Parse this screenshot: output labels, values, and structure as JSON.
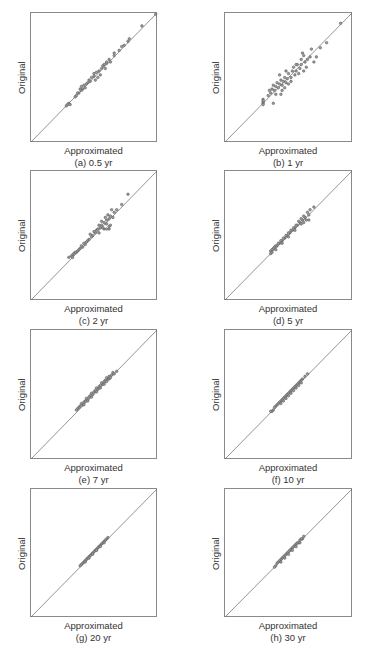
{
  "figure": {
    "colors": {
      "box": "#8a8a8a",
      "diagonal": "#666666",
      "point_fill": "#9a9a9a",
      "point_stroke": "#555555",
      "text": "#333333"
    }
  },
  "chart_data": [
    {
      "type": "scatter",
      "id": "a",
      "caption": "(a) 0.5 yr",
      "xlabel": "Approximated",
      "ylabel": "Original",
      "reference_line": "y = x",
      "ticks": "none",
      "grid": false,
      "points": [
        [
          0.99,
          0.99
        ],
        [
          0.88,
          0.9
        ],
        [
          0.78,
          0.8
        ],
        [
          0.77,
          0.78
        ],
        [
          0.72,
          0.74
        ],
        [
          0.7,
          0.71
        ],
        [
          0.66,
          0.67
        ],
        [
          0.62,
          0.64
        ],
        [
          0.6,
          0.61
        ],
        [
          0.58,
          0.6
        ],
        [
          0.56,
          0.57
        ],
        [
          0.54,
          0.55
        ],
        [
          0.52,
          0.54
        ],
        [
          0.5,
          0.51
        ],
        [
          0.48,
          0.5
        ],
        [
          0.47,
          0.47
        ],
        [
          0.45,
          0.46
        ],
        [
          0.44,
          0.45
        ],
        [
          0.42,
          0.44
        ],
        [
          0.41,
          0.41
        ],
        [
          0.4,
          0.4
        ],
        [
          0.39,
          0.41
        ],
        [
          0.38,
          0.38
        ],
        [
          0.37,
          0.38
        ],
        [
          0.36,
          0.36
        ],
        [
          0.35,
          0.35
        ],
        [
          0.55,
          0.52
        ],
        [
          0.53,
          0.5
        ],
        [
          0.57,
          0.59
        ],
        [
          0.6,
          0.62
        ],
        [
          0.63,
          0.62
        ],
        [
          0.51,
          0.48
        ],
        [
          0.46,
          0.48
        ],
        [
          0.43,
          0.42
        ],
        [
          0.59,
          0.57
        ],
        [
          0.3,
          0.3
        ],
        [
          0.29,
          0.29
        ],
        [
          0.28,
          0.28
        ],
        [
          0.4,
          0.43
        ],
        [
          0.5,
          0.53
        ],
        [
          0.66,
          0.69
        ],
        [
          0.74,
          0.75
        ],
        [
          0.31,
          0.29
        ]
      ]
    },
    {
      "type": "scatter",
      "id": "b",
      "caption": "(b) 1 yr",
      "xlabel": "Approximated",
      "ylabel": "Original",
      "reference_line": "y = x",
      "ticks": "none",
      "grid": false,
      "points": [
        [
          0.91,
          0.92
        ],
        [
          0.8,
          0.77
        ],
        [
          0.75,
          0.73
        ],
        [
          0.68,
          0.72
        ],
        [
          0.61,
          0.69
        ],
        [
          0.6,
          0.64
        ],
        [
          0.57,
          0.6
        ],
        [
          0.63,
          0.62
        ],
        [
          0.64,
          0.58
        ],
        [
          0.62,
          0.55
        ],
        [
          0.59,
          0.57
        ],
        [
          0.56,
          0.55
        ],
        [
          0.55,
          0.52
        ],
        [
          0.53,
          0.55
        ],
        [
          0.52,
          0.5
        ],
        [
          0.5,
          0.53
        ],
        [
          0.49,
          0.49
        ],
        [
          0.48,
          0.46
        ],
        [
          0.47,
          0.5
        ],
        [
          0.46,
          0.47
        ],
        [
          0.45,
          0.44
        ],
        [
          0.44,
          0.48
        ],
        [
          0.43,
          0.45
        ],
        [
          0.42,
          0.42
        ],
        [
          0.41,
          0.46
        ],
        [
          0.4,
          0.43
        ],
        [
          0.39,
          0.4
        ],
        [
          0.38,
          0.44
        ],
        [
          0.37,
          0.41
        ],
        [
          0.36,
          0.38
        ],
        [
          0.45,
          0.4
        ],
        [
          0.5,
          0.45
        ],
        [
          0.54,
          0.58
        ],
        [
          0.58,
          0.53
        ],
        [
          0.47,
          0.42
        ],
        [
          0.35,
          0.4
        ],
        [
          0.4,
          0.37
        ],
        [
          0.52,
          0.47
        ],
        [
          0.56,
          0.6
        ],
        [
          0.6,
          0.6
        ],
        [
          0.67,
          0.66
        ],
        [
          0.72,
          0.66
        ],
        [
          0.7,
          0.62
        ],
        [
          0.34,
          0.36
        ],
        [
          0.3,
          0.33
        ],
        [
          0.38,
          0.3
        ],
        [
          0.3,
          0.31
        ],
        [
          0.3,
          0.3
        ],
        [
          0.3,
          0.29
        ],
        [
          0.3,
          0.32
        ],
        [
          0.43,
          0.52
        ],
        [
          0.48,
          0.55
        ],
        [
          0.44,
          0.37
        ],
        [
          0.62,
          0.67
        ],
        [
          0.65,
          0.64
        ]
      ]
    },
    {
      "type": "scatter",
      "id": "c",
      "caption": "(c) 2 yr",
      "xlabel": "Approximated",
      "ylabel": "Original",
      "reference_line": "y = x",
      "ticks": "none",
      "grid": false,
      "points": [
        [
          0.77,
          0.82
        ],
        [
          0.72,
          0.74
        ],
        [
          0.66,
          0.68
        ],
        [
          0.64,
          0.7
        ],
        [
          0.63,
          0.65
        ],
        [
          0.62,
          0.63
        ],
        [
          0.6,
          0.62
        ],
        [
          0.59,
          0.64
        ],
        [
          0.58,
          0.6
        ],
        [
          0.56,
          0.58
        ],
        [
          0.55,
          0.56
        ],
        [
          0.54,
          0.58
        ],
        [
          0.52,
          0.54
        ],
        [
          0.51,
          0.52
        ],
        [
          0.5,
          0.53
        ],
        [
          0.49,
          0.5
        ],
        [
          0.48,
          0.49
        ],
        [
          0.47,
          0.51
        ],
        [
          0.46,
          0.47
        ],
        [
          0.45,
          0.46
        ],
        [
          0.44,
          0.45
        ],
        [
          0.43,
          0.43
        ],
        [
          0.42,
          0.44
        ],
        [
          0.41,
          0.41
        ],
        [
          0.4,
          0.42
        ],
        [
          0.39,
          0.4
        ],
        [
          0.38,
          0.39
        ],
        [
          0.37,
          0.38
        ],
        [
          0.36,
          0.37
        ],
        [
          0.35,
          0.37
        ],
        [
          0.34,
          0.36
        ],
        [
          0.33,
          0.35
        ],
        [
          0.32,
          0.34
        ],
        [
          0.62,
          0.57
        ],
        [
          0.58,
          0.55
        ],
        [
          0.6,
          0.59
        ],
        [
          0.57,
          0.56
        ],
        [
          0.54,
          0.52
        ],
        [
          0.53,
          0.55
        ],
        [
          0.56,
          0.61
        ],
        [
          0.61,
          0.66
        ],
        [
          0.65,
          0.64
        ],
        [
          0.68,
          0.7
        ],
        [
          0.3,
          0.33
        ],
        [
          0.33,
          0.33
        ],
        [
          0.62,
          0.55
        ],
        [
          0.63,
          0.58
        ],
        [
          0.6,
          0.55
        ]
      ]
    },
    {
      "type": "scatter",
      "id": "d",
      "caption": "(d) 5 yr",
      "xlabel": "Approximated",
      "ylabel": "Original",
      "reference_line": "y = x",
      "ticks": "none",
      "grid": false,
      "points": [
        [
          0.7,
          0.72
        ],
        [
          0.67,
          0.7
        ],
        [
          0.66,
          0.66
        ],
        [
          0.65,
          0.68
        ],
        [
          0.63,
          0.64
        ],
        [
          0.62,
          0.65
        ],
        [
          0.61,
          0.62
        ],
        [
          0.6,
          0.63
        ],
        [
          0.59,
          0.6
        ],
        [
          0.58,
          0.61
        ],
        [
          0.57,
          0.58
        ],
        [
          0.56,
          0.58
        ],
        [
          0.55,
          0.56
        ],
        [
          0.54,
          0.56
        ],
        [
          0.53,
          0.54
        ],
        [
          0.52,
          0.54
        ],
        [
          0.51,
          0.52
        ],
        [
          0.5,
          0.52
        ],
        [
          0.49,
          0.5
        ],
        [
          0.48,
          0.5
        ],
        [
          0.47,
          0.48
        ],
        [
          0.46,
          0.48
        ],
        [
          0.45,
          0.46
        ],
        [
          0.44,
          0.46
        ],
        [
          0.43,
          0.44
        ],
        [
          0.42,
          0.44
        ],
        [
          0.41,
          0.42
        ],
        [
          0.4,
          0.42
        ],
        [
          0.39,
          0.41
        ],
        [
          0.38,
          0.4
        ],
        [
          0.37,
          0.39
        ],
        [
          0.36,
          0.38
        ],
        [
          0.36,
          0.36
        ],
        [
          0.37,
          0.37
        ],
        [
          0.64,
          0.62
        ],
        [
          0.62,
          0.6
        ],
        [
          0.66,
          0.62
        ],
        [
          0.6,
          0.59
        ],
        [
          0.55,
          0.54
        ],
        [
          0.5,
          0.49
        ],
        [
          0.45,
          0.44
        ],
        [
          0.4,
          0.39
        ]
      ]
    },
    {
      "type": "scatter",
      "id": "e",
      "caption": "(e) 7 yr",
      "xlabel": "Approximated",
      "ylabel": "Original",
      "reference_line": "y = x",
      "ticks": "none",
      "grid": false,
      "points": [
        [
          0.68,
          0.68
        ],
        [
          0.65,
          0.67
        ],
        [
          0.64,
          0.65
        ],
        [
          0.62,
          0.64
        ],
        [
          0.61,
          0.62
        ],
        [
          0.6,
          0.63
        ],
        [
          0.59,
          0.61
        ],
        [
          0.58,
          0.6
        ],
        [
          0.57,
          0.58
        ],
        [
          0.56,
          0.59
        ],
        [
          0.55,
          0.57
        ],
        [
          0.54,
          0.56
        ],
        [
          0.53,
          0.54
        ],
        [
          0.52,
          0.55
        ],
        [
          0.51,
          0.53
        ],
        [
          0.5,
          0.52
        ],
        [
          0.49,
          0.5
        ],
        [
          0.48,
          0.51
        ],
        [
          0.47,
          0.49
        ],
        [
          0.46,
          0.48
        ],
        [
          0.45,
          0.46
        ],
        [
          0.44,
          0.47
        ],
        [
          0.43,
          0.45
        ],
        [
          0.42,
          0.44
        ],
        [
          0.41,
          0.42
        ],
        [
          0.4,
          0.43
        ],
        [
          0.39,
          0.41
        ],
        [
          0.38,
          0.4
        ],
        [
          0.37,
          0.39
        ],
        [
          0.36,
          0.38
        ],
        [
          0.6,
          0.6
        ],
        [
          0.62,
          0.62
        ],
        [
          0.58,
          0.58
        ],
        [
          0.55,
          0.55
        ],
        [
          0.52,
          0.52
        ],
        [
          0.48,
          0.48
        ],
        [
          0.45,
          0.45
        ],
        [
          0.42,
          0.42
        ],
        [
          0.66,
          0.66
        ],
        [
          0.63,
          0.63
        ]
      ]
    },
    {
      "type": "scatter",
      "id": "f",
      "caption": "(f) 10 yr",
      "xlabel": "Approximated",
      "ylabel": "Original",
      "reference_line": "y = x",
      "ticks": "none",
      "grid": false,
      "points": [
        [
          0.65,
          0.66
        ],
        [
          0.63,
          0.64
        ],
        [
          0.61,
          0.62
        ],
        [
          0.6,
          0.61
        ],
        [
          0.59,
          0.6
        ],
        [
          0.58,
          0.59
        ],
        [
          0.57,
          0.58
        ],
        [
          0.56,
          0.57
        ],
        [
          0.55,
          0.56
        ],
        [
          0.54,
          0.55
        ],
        [
          0.53,
          0.54
        ],
        [
          0.52,
          0.53
        ],
        [
          0.51,
          0.52
        ],
        [
          0.5,
          0.51
        ],
        [
          0.49,
          0.5
        ],
        [
          0.48,
          0.49
        ],
        [
          0.47,
          0.48
        ],
        [
          0.46,
          0.47
        ],
        [
          0.45,
          0.46
        ],
        [
          0.44,
          0.45
        ],
        [
          0.43,
          0.44
        ],
        [
          0.42,
          0.43
        ],
        [
          0.41,
          0.42
        ],
        [
          0.4,
          0.41
        ],
        [
          0.39,
          0.4
        ],
        [
          0.38,
          0.38
        ],
        [
          0.37,
          0.37
        ],
        [
          0.36,
          0.37
        ],
        [
          0.6,
          0.59
        ],
        [
          0.58,
          0.57
        ],
        [
          0.56,
          0.55
        ],
        [
          0.54,
          0.53
        ],
        [
          0.52,
          0.51
        ],
        [
          0.5,
          0.49
        ],
        [
          0.48,
          0.47
        ],
        [
          0.46,
          0.45
        ],
        [
          0.44,
          0.43
        ]
      ]
    },
    {
      "type": "scatter",
      "id": "g",
      "caption": "(g) 20 yr",
      "xlabel": "Approximated",
      "ylabel": "Original",
      "reference_line": "y = x",
      "ticks": "none",
      "grid": false,
      "points": [
        [
          0.61,
          0.62
        ],
        [
          0.6,
          0.61
        ],
        [
          0.59,
          0.6
        ],
        [
          0.58,
          0.59
        ],
        [
          0.57,
          0.58
        ],
        [
          0.56,
          0.57
        ],
        [
          0.55,
          0.56
        ],
        [
          0.54,
          0.55
        ],
        [
          0.53,
          0.54
        ],
        [
          0.52,
          0.53
        ],
        [
          0.51,
          0.52
        ],
        [
          0.5,
          0.51
        ],
        [
          0.49,
          0.5
        ],
        [
          0.48,
          0.49
        ],
        [
          0.47,
          0.48
        ],
        [
          0.46,
          0.47
        ],
        [
          0.45,
          0.46
        ],
        [
          0.44,
          0.45
        ],
        [
          0.43,
          0.44
        ],
        [
          0.42,
          0.43
        ],
        [
          0.41,
          0.42
        ],
        [
          0.4,
          0.41
        ],
        [
          0.39,
          0.4
        ],
        [
          0.58,
          0.58
        ],
        [
          0.55,
          0.55
        ],
        [
          0.52,
          0.52
        ],
        [
          0.49,
          0.49
        ],
        [
          0.46,
          0.46
        ],
        [
          0.43,
          0.43
        ]
      ]
    },
    {
      "type": "scatter",
      "id": "h",
      "caption": "(h) 30 yr",
      "xlabel": "Approximated",
      "ylabel": "Original",
      "reference_line": "y = x",
      "ticks": "none",
      "grid": false,
      "points": [
        [
          0.62,
          0.63
        ],
        [
          0.61,
          0.61
        ],
        [
          0.6,
          0.61
        ],
        [
          0.59,
          0.6
        ],
        [
          0.58,
          0.58
        ],
        [
          0.57,
          0.58
        ],
        [
          0.56,
          0.57
        ],
        [
          0.55,
          0.56
        ],
        [
          0.54,
          0.55
        ],
        [
          0.53,
          0.54
        ],
        [
          0.52,
          0.53
        ],
        [
          0.51,
          0.52
        ],
        [
          0.5,
          0.51
        ],
        [
          0.49,
          0.5
        ],
        [
          0.48,
          0.49
        ],
        [
          0.47,
          0.48
        ],
        [
          0.46,
          0.47
        ],
        [
          0.45,
          0.46
        ],
        [
          0.44,
          0.45
        ],
        [
          0.43,
          0.44
        ],
        [
          0.42,
          0.43
        ],
        [
          0.41,
          0.42
        ],
        [
          0.4,
          0.4
        ],
        [
          0.39,
          0.39
        ],
        [
          0.59,
          0.58
        ],
        [
          0.56,
          0.55
        ],
        [
          0.53,
          0.52
        ],
        [
          0.5,
          0.49
        ],
        [
          0.47,
          0.46
        ],
        [
          0.44,
          0.43
        ]
      ]
    }
  ]
}
